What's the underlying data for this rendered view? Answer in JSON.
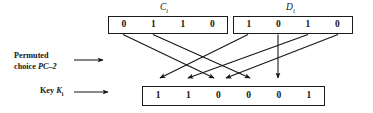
{
  "figure": {
    "kind": "des-key-schedule-pc2-permutation",
    "registers": {
      "c": {
        "caption_base": "C",
        "caption_sub": "i",
        "bits": [
          "0",
          "1",
          "1",
          "0"
        ]
      },
      "d": {
        "caption_base": "D",
        "caption_sub": "i",
        "bits": [
          "1",
          "0",
          "1",
          "0"
        ]
      },
      "k": {
        "bits": [
          "1",
          "1",
          "0",
          "0",
          "0",
          "1"
        ]
      }
    },
    "labels": {
      "pc2_line1": "Permuted",
      "pc2_line2_prefix": "choice ",
      "pc2_line2_italic": "PC",
      "pc2_line2_suffix": "–2",
      "key_prefix": "Key ",
      "key_italic": "K",
      "key_sub": "i"
    },
    "colors": {
      "ink": "#141414",
      "stroke": "#1a1a1a",
      "background": "#ffffff"
    }
  }
}
